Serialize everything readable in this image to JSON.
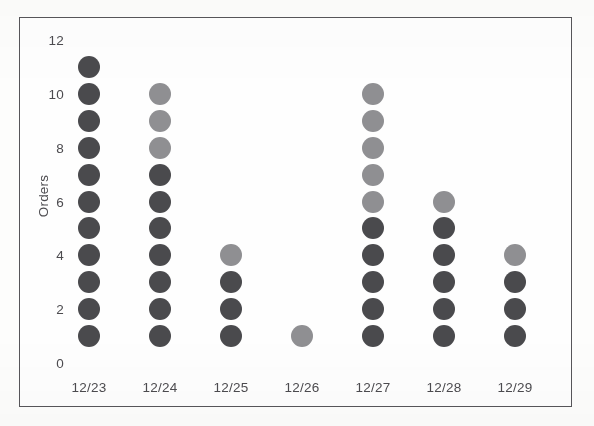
{
  "chart_data": {
    "type": "scatter",
    "plot_style": "dot-plot",
    "title": "",
    "xlabel": "",
    "ylabel": "Orders",
    "categories": [
      "12/23",
      "12/24",
      "12/25",
      "12/26",
      "12/27",
      "12/28",
      "12/29"
    ],
    "values": [
      11,
      10,
      4,
      1,
      10,
      6,
      4
    ],
    "ylim": [
      0,
      12
    ],
    "y_ticks": [
      0,
      2,
      4,
      6,
      8,
      10,
      12
    ],
    "y_tick_labels": [
      "0",
      "2",
      "4",
      "6",
      "8",
      "10",
      "12"
    ],
    "grid": false,
    "legend": "none",
    "dot_step": 1,
    "dot_start": 1,
    "series": [
      {
        "name": "Orders",
        "categories": [
          "12/23",
          "12/24",
          "12/25",
          "12/26",
          "12/27",
          "12/28",
          "12/29"
        ],
        "values": [
          11,
          10,
          4,
          1,
          10,
          6,
          4
        ],
        "points": [
          {
            "x": "12/23",
            "count": 11,
            "stack": [
              1,
              2,
              3,
              4,
              5,
              6,
              7,
              8,
              9,
              10,
              11
            ],
            "shades": [
              "dark",
              "dark",
              "dark",
              "dark",
              "dark",
              "dark",
              "dark",
              "dark",
              "dark",
              "dark",
              "dark"
            ]
          },
          {
            "x": "12/24",
            "count": 10,
            "stack": [
              1,
              2,
              3,
              4,
              5,
              6,
              7,
              8,
              9,
              10
            ],
            "shades": [
              "dark",
              "dark",
              "dark",
              "dark",
              "dark",
              "dark",
              "dark",
              "light",
              "light",
              "light"
            ]
          },
          {
            "x": "12/25",
            "count": 4,
            "stack": [
              1,
              2,
              3,
              4
            ],
            "shades": [
              "dark",
              "dark",
              "dark",
              "light"
            ]
          },
          {
            "x": "12/26",
            "count": 1,
            "stack": [
              1
            ],
            "shades": [
              "light"
            ]
          },
          {
            "x": "12/27",
            "count": 10,
            "stack": [
              1,
              2,
              3,
              4,
              5,
              6,
              7,
              8,
              9,
              10
            ],
            "shades": [
              "dark",
              "dark",
              "dark",
              "dark",
              "dark",
              "light",
              "light",
              "light",
              "light",
              "light"
            ]
          },
          {
            "x": "12/28",
            "count": 6,
            "stack": [
              1,
              2,
              3,
              4,
              5,
              6
            ],
            "shades": [
              "dark",
              "dark",
              "dark",
              "dark",
              "dark",
              "light"
            ]
          },
          {
            "x": "12/29",
            "count": 4,
            "stack": [
              1,
              2,
              3,
              4
            ],
            "shades": [
              "dark",
              "dark",
              "dark",
              "light"
            ]
          }
        ]
      }
    ],
    "colors": {
      "dot_dark": "#4a4a4d",
      "dot_light": "#8f8f92",
      "axis_text": "#4c4b4f",
      "frame": "#57565a",
      "background": "#fefefe"
    }
  }
}
